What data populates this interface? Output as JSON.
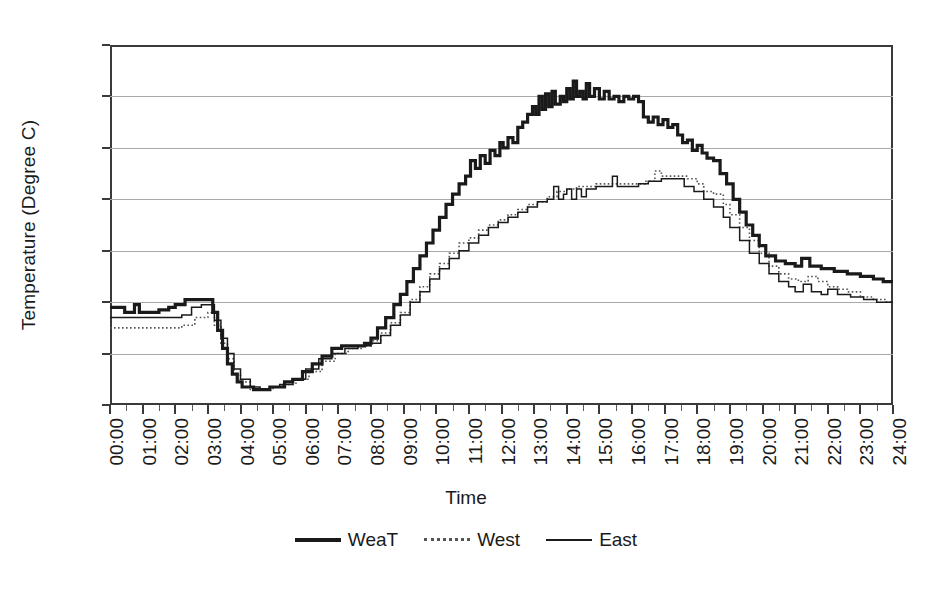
{
  "chart_data": {
    "type": "line",
    "title": "",
    "xlabel": "Time",
    "ylabel": "Temperature (Degree C)",
    "ylim": [
      23.0,
      37.0
    ],
    "ytick_labels": [
      "23.0",
      "25.0",
      "27.0",
      "29.0",
      "31.0",
      "33.0",
      "35.0",
      "37.0"
    ],
    "ytick_values": [
      23.0,
      25.0,
      27.0,
      29.0,
      31.0,
      33.0,
      35.0,
      37.0
    ],
    "grid": true,
    "legend_position": "bottom",
    "x": [
      "00:00",
      "01:00",
      "02:00",
      "03:00",
      "04:00",
      "05:00",
      "06:00",
      "07:00",
      "08:00",
      "09:00",
      "10:00",
      "11:00",
      "12:00",
      "13:00",
      "14:00",
      "15:00",
      "16:00",
      "17:00",
      "18:00",
      "19:00",
      "20:00",
      "21:00",
      "22:00",
      "23:00",
      "24:00"
    ],
    "xlim_hours": [
      0,
      24
    ],
    "series": [
      {
        "name": "WeaT",
        "style": "thick-solid",
        "color": "#1a1a1a",
        "values": [
          26.8,
          26.8,
          26.9,
          27.1,
          24.0,
          23.7,
          24.4,
          25.3,
          26.4,
          28.6,
          31.0,
          32.8,
          34.6,
          35.1,
          35.6,
          35.2,
          34.9,
          33.4,
          32.6,
          30.6,
          28.6,
          28.3,
          28.1,
          27.9,
          27.8
        ],
        "sample_points": [
          [
            0.0,
            26.8
          ],
          [
            0.2,
            26.8
          ],
          [
            0.45,
            26.6
          ],
          [
            0.6,
            26.6
          ],
          [
            0.75,
            26.9
          ],
          [
            0.9,
            26.6
          ],
          [
            1.1,
            26.6
          ],
          [
            1.5,
            26.7
          ],
          [
            1.8,
            26.8
          ],
          [
            2.0,
            26.9
          ],
          [
            2.3,
            27.1
          ],
          [
            2.6,
            27.1
          ],
          [
            3.0,
            27.1
          ],
          [
            3.15,
            26.6
          ],
          [
            3.3,
            25.9
          ],
          [
            3.45,
            25.2
          ],
          [
            3.6,
            24.6
          ],
          [
            3.75,
            24.2
          ],
          [
            3.9,
            23.9
          ],
          [
            4.05,
            23.7
          ],
          [
            4.4,
            23.6
          ],
          [
            4.7,
            23.6
          ],
          [
            4.9,
            23.7
          ],
          [
            5.1,
            23.7
          ],
          [
            5.35,
            23.9
          ],
          [
            5.6,
            24.0
          ],
          [
            5.9,
            24.3
          ],
          [
            6.2,
            24.6
          ],
          [
            6.5,
            24.9
          ],
          [
            6.8,
            25.2
          ],
          [
            7.1,
            25.3
          ],
          [
            7.5,
            25.3
          ],
          [
            7.8,
            25.4
          ],
          [
            8.0,
            25.6
          ],
          [
            8.2,
            26.0
          ],
          [
            8.45,
            26.4
          ],
          [
            8.7,
            26.9
          ],
          [
            8.9,
            27.3
          ],
          [
            9.1,
            27.8
          ],
          [
            9.3,
            28.3
          ],
          [
            9.5,
            28.8
          ],
          [
            9.7,
            29.3
          ],
          [
            9.9,
            29.8
          ],
          [
            10.1,
            30.3
          ],
          [
            10.3,
            30.8
          ],
          [
            10.5,
            31.2
          ],
          [
            10.7,
            31.6
          ],
          [
            10.9,
            31.9
          ],
          [
            11.05,
            32.5
          ],
          [
            11.2,
            32.2
          ],
          [
            11.35,
            32.7
          ],
          [
            11.5,
            32.4
          ],
          [
            11.65,
            32.9
          ],
          [
            11.8,
            32.7
          ],
          [
            11.95,
            33.2
          ],
          [
            12.05,
            33.0
          ],
          [
            12.2,
            33.4
          ],
          [
            12.35,
            33.2
          ],
          [
            12.5,
            33.8
          ],
          [
            12.65,
            34.0
          ],
          [
            12.8,
            34.3
          ],
          [
            12.95,
            34.6
          ],
          [
            13.05,
            34.3
          ],
          [
            13.15,
            35.0
          ],
          [
            13.25,
            34.5
          ],
          [
            13.35,
            35.1
          ],
          [
            13.45,
            34.6
          ],
          [
            13.55,
            35.2
          ],
          [
            13.65,
            34.7
          ],
          [
            13.8,
            35.0
          ],
          [
            13.9,
            34.8
          ],
          [
            14.0,
            35.3
          ],
          [
            14.1,
            34.9
          ],
          [
            14.2,
            35.6
          ],
          [
            14.3,
            35.0
          ],
          [
            14.4,
            35.2
          ],
          [
            14.5,
            34.9
          ],
          [
            14.6,
            35.5
          ],
          [
            14.7,
            35.0
          ],
          [
            14.85,
            35.3
          ],
          [
            15.0,
            34.9
          ],
          [
            15.15,
            35.2
          ],
          [
            15.3,
            34.9
          ],
          [
            15.45,
            35.0
          ],
          [
            15.6,
            34.8
          ],
          [
            15.75,
            35.0
          ],
          [
            15.9,
            34.9
          ],
          [
            16.05,
            35.0
          ],
          [
            16.2,
            34.8
          ],
          [
            16.35,
            34.2
          ],
          [
            16.5,
            34.0
          ],
          [
            16.65,
            34.2
          ],
          [
            16.8,
            33.9
          ],
          [
            16.95,
            34.1
          ],
          [
            17.1,
            33.8
          ],
          [
            17.25,
            33.9
          ],
          [
            17.4,
            33.5
          ],
          [
            17.55,
            33.2
          ],
          [
            17.7,
            33.3
          ],
          [
            17.85,
            32.9
          ],
          [
            18.0,
            33.1
          ],
          [
            18.15,
            32.8
          ],
          [
            18.3,
            32.6
          ],
          [
            18.5,
            32.5
          ],
          [
            18.7,
            32.0
          ],
          [
            18.9,
            31.6
          ],
          [
            19.1,
            31.0
          ],
          [
            19.3,
            30.5
          ],
          [
            19.5,
            30.0
          ],
          [
            19.7,
            29.6
          ],
          [
            19.9,
            29.2
          ],
          [
            20.1,
            28.8
          ],
          [
            20.4,
            28.6
          ],
          [
            20.7,
            28.5
          ],
          [
            21.0,
            28.4
          ],
          [
            21.2,
            28.7
          ],
          [
            21.45,
            28.4
          ],
          [
            21.8,
            28.3
          ],
          [
            22.2,
            28.2
          ],
          [
            22.6,
            28.1
          ],
          [
            23.0,
            28.0
          ],
          [
            23.4,
            27.9
          ],
          [
            23.7,
            27.8
          ],
          [
            24.0,
            27.8
          ]
        ]
      },
      {
        "name": "West",
        "style": "dotted",
        "color": "#555555",
        "values": [
          26.0,
          26.0,
          26.0,
          26.8,
          23.8,
          23.6,
          24.2,
          25.0,
          25.7,
          27.4,
          29.4,
          30.4,
          31.0,
          31.3,
          31.6,
          31.6,
          31.9,
          31.6,
          31.2,
          29.9,
          28.2,
          27.8,
          27.4,
          27.2,
          27.0
        ],
        "sample_points": [
          [
            0.0,
            26.0
          ],
          [
            0.6,
            26.0
          ],
          [
            1.2,
            26.0
          ],
          [
            1.9,
            26.0
          ],
          [
            2.2,
            26.1
          ],
          [
            2.6,
            26.4
          ],
          [
            3.0,
            26.6
          ],
          [
            3.2,
            26.1
          ],
          [
            3.4,
            25.4
          ],
          [
            3.6,
            24.8
          ],
          [
            3.8,
            24.2
          ],
          [
            4.0,
            23.9
          ],
          [
            4.3,
            23.6
          ],
          [
            4.7,
            23.6
          ],
          [
            5.0,
            23.7
          ],
          [
            5.3,
            23.8
          ],
          [
            5.7,
            24.0
          ],
          [
            6.1,
            24.3
          ],
          [
            6.5,
            24.7
          ],
          [
            6.9,
            25.0
          ],
          [
            7.3,
            25.2
          ],
          [
            7.7,
            25.3
          ],
          [
            8.0,
            25.5
          ],
          [
            8.3,
            25.8
          ],
          [
            8.6,
            26.2
          ],
          [
            8.9,
            26.6
          ],
          [
            9.2,
            27.1
          ],
          [
            9.5,
            27.6
          ],
          [
            9.8,
            28.1
          ],
          [
            10.1,
            28.5
          ],
          [
            10.4,
            28.9
          ],
          [
            10.7,
            29.3
          ],
          [
            11.0,
            29.5
          ],
          [
            11.3,
            29.8
          ],
          [
            11.6,
            30.0
          ],
          [
            11.9,
            30.2
          ],
          [
            12.2,
            30.4
          ],
          [
            12.5,
            30.6
          ],
          [
            12.8,
            30.8
          ],
          [
            13.1,
            30.9
          ],
          [
            13.4,
            31.1
          ],
          [
            13.7,
            31.3
          ],
          [
            14.0,
            31.4
          ],
          [
            14.3,
            31.5
          ],
          [
            14.6,
            31.5
          ],
          [
            14.9,
            31.6
          ],
          [
            15.2,
            31.6
          ],
          [
            15.5,
            31.6
          ],
          [
            15.8,
            31.6
          ],
          [
            16.1,
            31.6
          ],
          [
            16.4,
            31.7
          ],
          [
            16.7,
            32.1
          ],
          [
            16.9,
            31.9
          ],
          [
            17.3,
            31.9
          ],
          [
            17.7,
            31.8
          ],
          [
            18.0,
            31.6
          ],
          [
            18.2,
            31.3
          ],
          [
            18.5,
            31.2
          ],
          [
            18.8,
            30.8
          ],
          [
            19.0,
            30.4
          ],
          [
            19.3,
            29.9
          ],
          [
            19.6,
            29.4
          ],
          [
            19.9,
            28.9
          ],
          [
            20.2,
            28.4
          ],
          [
            20.5,
            28.1
          ],
          [
            20.8,
            27.9
          ],
          [
            21.1,
            27.8
          ],
          [
            21.4,
            28.0
          ],
          [
            21.7,
            27.8
          ],
          [
            22.0,
            27.6
          ],
          [
            22.3,
            27.5
          ],
          [
            22.6,
            27.4
          ],
          [
            23.0,
            27.2
          ],
          [
            23.4,
            27.1
          ],
          [
            23.8,
            27.0
          ],
          [
            24.0,
            27.0
          ]
        ]
      },
      {
        "name": "East",
        "style": "thin-solid",
        "color": "#1a1a1a",
        "values": [
          26.4,
          26.4,
          26.4,
          26.9,
          23.9,
          23.6,
          24.3,
          25.1,
          25.6,
          27.2,
          29.2,
          30.2,
          30.8,
          31.2,
          31.5,
          31.6,
          31.8,
          31.5,
          30.9,
          29.6,
          28.0,
          27.6,
          27.3,
          27.1,
          27.0
        ],
        "sample_points": [
          [
            0.0,
            26.4
          ],
          [
            0.4,
            26.4
          ],
          [
            0.9,
            26.4
          ],
          [
            1.4,
            26.4
          ],
          [
            1.9,
            26.4
          ],
          [
            2.2,
            26.5
          ],
          [
            2.5,
            26.8
          ],
          [
            2.8,
            26.9
          ],
          [
            3.0,
            26.9
          ],
          [
            3.2,
            26.3
          ],
          [
            3.4,
            25.6
          ],
          [
            3.6,
            25.0
          ],
          [
            3.8,
            24.4
          ],
          [
            4.0,
            24.0
          ],
          [
            4.3,
            23.7
          ],
          [
            4.6,
            23.6
          ],
          [
            4.9,
            23.7
          ],
          [
            5.2,
            23.8
          ],
          [
            5.6,
            24.0
          ],
          [
            6.0,
            24.4
          ],
          [
            6.4,
            24.8
          ],
          [
            6.8,
            25.0
          ],
          [
            7.2,
            25.2
          ],
          [
            7.6,
            25.3
          ],
          [
            8.0,
            25.4
          ],
          [
            8.3,
            25.7
          ],
          [
            8.6,
            26.1
          ],
          [
            8.9,
            26.5
          ],
          [
            9.2,
            27.0
          ],
          [
            9.5,
            27.4
          ],
          [
            9.8,
            27.9
          ],
          [
            10.1,
            28.3
          ],
          [
            10.4,
            28.7
          ],
          [
            10.7,
            29.0
          ],
          [
            11.0,
            29.3
          ],
          [
            11.3,
            29.6
          ],
          [
            11.6,
            29.9
          ],
          [
            11.9,
            30.1
          ],
          [
            12.2,
            30.3
          ],
          [
            12.5,
            30.5
          ],
          [
            12.8,
            30.7
          ],
          [
            13.1,
            30.9
          ],
          [
            13.4,
            31.0
          ],
          [
            13.6,
            31.5
          ],
          [
            13.75,
            31.0
          ],
          [
            13.9,
            31.2
          ],
          [
            14.0,
            31.4
          ],
          [
            14.15,
            31.0
          ],
          [
            14.3,
            31.4
          ],
          [
            14.45,
            31.1
          ],
          [
            14.6,
            31.4
          ],
          [
            14.9,
            31.5
          ],
          [
            15.2,
            31.5
          ],
          [
            15.4,
            31.9
          ],
          [
            15.55,
            31.5
          ],
          [
            15.9,
            31.5
          ],
          [
            16.2,
            31.6
          ],
          [
            16.5,
            31.7
          ],
          [
            16.9,
            31.8
          ],
          [
            17.3,
            31.8
          ],
          [
            17.6,
            31.5
          ],
          [
            17.9,
            31.3
          ],
          [
            18.2,
            31.0
          ],
          [
            18.5,
            30.7
          ],
          [
            18.8,
            30.3
          ],
          [
            19.0,
            29.9
          ],
          [
            19.3,
            29.4
          ],
          [
            19.6,
            28.9
          ],
          [
            19.9,
            28.5
          ],
          [
            20.2,
            28.1
          ],
          [
            20.5,
            27.8
          ],
          [
            20.8,
            27.6
          ],
          [
            21.0,
            27.4
          ],
          [
            21.25,
            27.7
          ],
          [
            21.5,
            27.4
          ],
          [
            21.8,
            27.3
          ],
          [
            22.0,
            27.5
          ],
          [
            22.3,
            27.3
          ],
          [
            22.7,
            27.2
          ],
          [
            23.1,
            27.1
          ],
          [
            23.5,
            27.0
          ],
          [
            24.0,
            27.0
          ]
        ]
      }
    ]
  }
}
